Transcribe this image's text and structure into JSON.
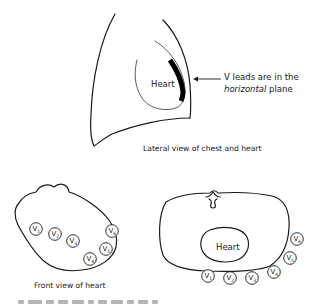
{
  "lateral_view": {
    "heart_label": "Heart",
    "annotation_line1": "V leads are in the",
    "annotation_line2_italic": "horizontal",
    "annotation_line2_rest": " plane",
    "caption": "Lateral view of chest and heart"
  },
  "front_view": {
    "caption": "Front view of heart",
    "leads": [
      {
        "main": "V",
        "sub": "1"
      },
      {
        "main": "V",
        "sub": "2"
      },
      {
        "main": "V",
        "sub": "3"
      },
      {
        "main": "V",
        "sub": "4"
      },
      {
        "main": "V",
        "sub": "5"
      },
      {
        "main": "V",
        "sub": "6"
      }
    ]
  },
  "horizontal_view": {
    "heart_label": "Heart",
    "leads": [
      {
        "main": "V",
        "sub": "1"
      },
      {
        "main": "V",
        "sub": "2"
      },
      {
        "main": "V",
        "sub": "3"
      },
      {
        "main": "V",
        "sub": "4"
      },
      {
        "main": "V",
        "sub": "5"
      },
      {
        "main": "V",
        "sub": "6"
      }
    ]
  },
  "footer": {
    "cutoff_text": "Cut off text line (illegible)"
  }
}
